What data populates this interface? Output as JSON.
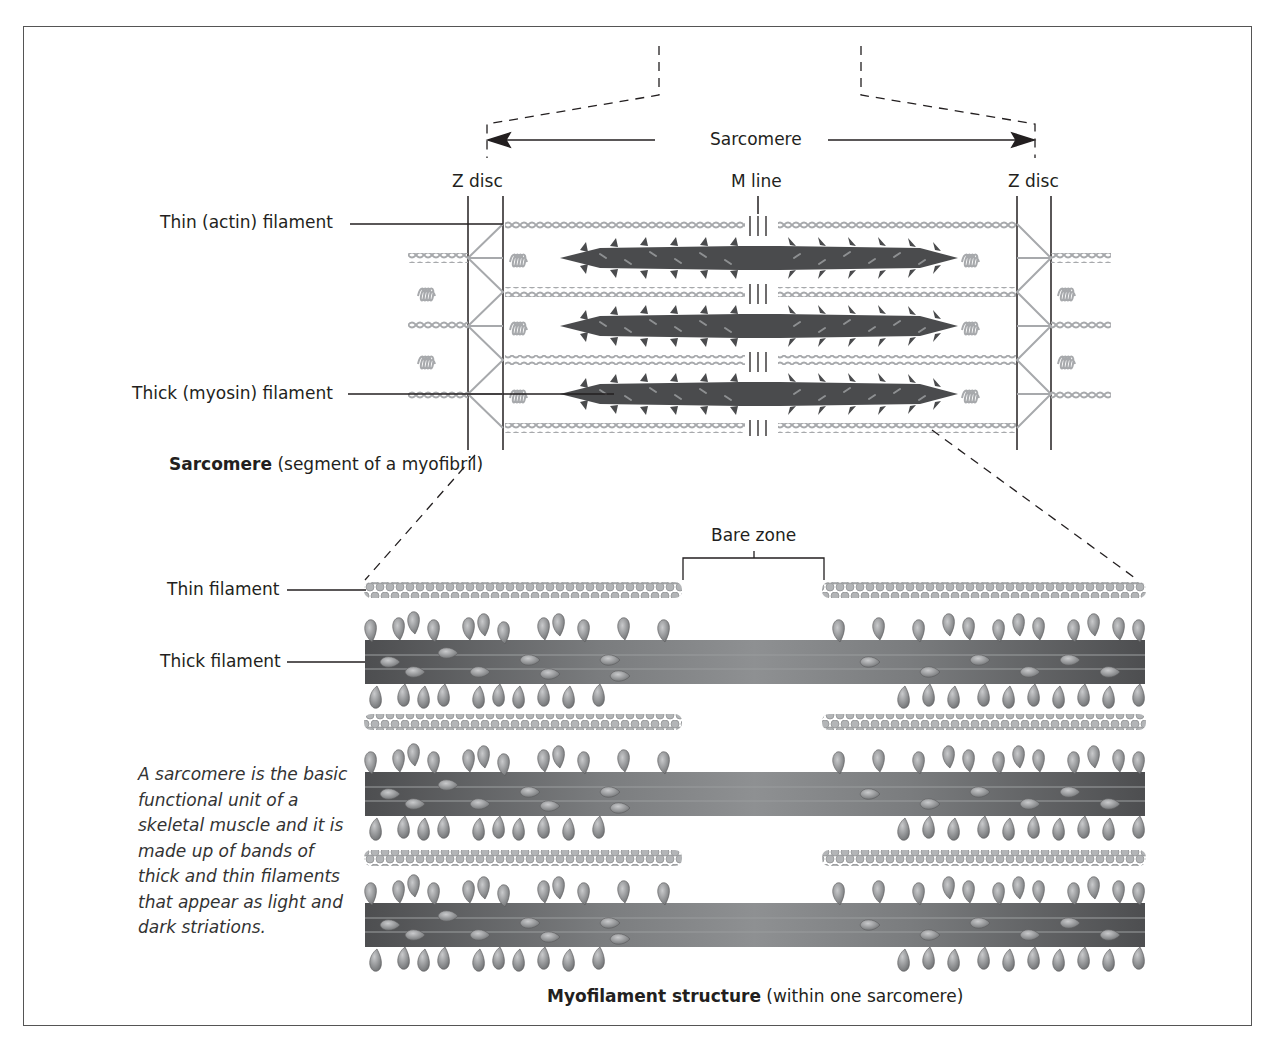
{
  "labels": {
    "sarcomere_span": "Sarcomere",
    "z_disc_left": "Z disc",
    "m_line": "M line",
    "z_disc_right": "Z disc",
    "thin_actin": "Thin (actin) filament",
    "thick_myosin": "Thick (myosin) filament",
    "bare_zone": "Bare zone",
    "thin_filament": "Thin filament",
    "thick_filament": "Thick filament"
  },
  "captions": {
    "top_bold": "Sarcomere",
    "top_rest": " (segment of a myofibril)",
    "bottom_bold": "Myofilament structure",
    "bottom_rest": " (within one sarcomere)"
  },
  "note": "A sarcomere is the basic functional unit of a skeletal muscle and it is made up of bands of thick and thin filaments that appear as light and dark striations.",
  "colors": {
    "frame": "#555555",
    "line": "#231f20",
    "thin_filament": "#a7a9ac",
    "thick_filament_dark": "#58595b",
    "thick_filament_light": "#939598",
    "myosin_head": "#8a8c8e"
  }
}
